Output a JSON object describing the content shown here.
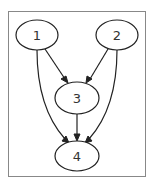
{
  "diagram": {
    "type": "directed-graph",
    "nodes": [
      {
        "id": "1",
        "label": "1"
      },
      {
        "id": "2",
        "label": "2"
      },
      {
        "id": "3",
        "label": "3"
      },
      {
        "id": "4",
        "label": "4"
      }
    ],
    "edges": [
      {
        "from": "1",
        "to": "3"
      },
      {
        "from": "1",
        "to": "4"
      },
      {
        "from": "2",
        "to": "3"
      },
      {
        "from": "2",
        "to": "4"
      },
      {
        "from": "3",
        "to": "4"
      }
    ]
  }
}
